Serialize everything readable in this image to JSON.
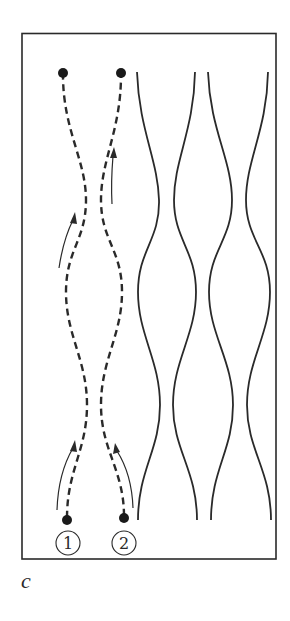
{
  "figure": {
    "panel_label": "c",
    "frame": {
      "x": 22,
      "y": 33,
      "width": 254,
      "height": 526
    },
    "colors": {
      "line": "#2a2a2a",
      "dot": "#1a1a1a",
      "background": "#ffffff"
    },
    "particles": [
      {
        "id": 1,
        "label": "1",
        "start": {
          "x": 67,
          "y": 520
        },
        "end": {
          "x": 63,
          "y": 73
        }
      },
      {
        "id": 2,
        "label": "2",
        "start": {
          "x": 124,
          "y": 518
        },
        "end": {
          "x": 121,
          "y": 73
        }
      }
    ],
    "solid_curve_count": 4,
    "arrow_count": 4
  }
}
